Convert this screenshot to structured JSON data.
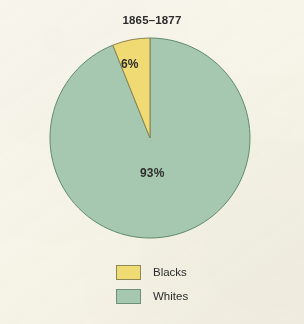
{
  "figure": {
    "width": 304,
    "height": 324,
    "background_color": "#faf8ef"
  },
  "chart_data": {
    "type": "pie",
    "title": "1865–1877",
    "subtitle": "",
    "xlabel": "",
    "ylabel": "",
    "grid": false,
    "legend_position": "bottom",
    "start_angle_deg": 90,
    "direction": "counterclockwise",
    "categories": [
      "Blacks",
      "Whites"
    ],
    "values": [
      6,
      93
    ],
    "value_labels": [
      "6%",
      "93%"
    ],
    "unit": "%",
    "colors": [
      "#f0da73",
      "#a7c8b0"
    ],
    "edge_colors": [
      "#8e8a55",
      "#6e8f79"
    ],
    "slices": [
      {
        "name": "Blacks",
        "value": 6,
        "label": "6%",
        "color": "#f0da73",
        "edge_color": "#8e8a55"
      },
      {
        "name": "Whites",
        "value": 93,
        "label": "93%",
        "color": "#a7c8b0",
        "edge_color": "#6e8f79"
      }
    ],
    "legend": [
      {
        "label": "Blacks",
        "color": "#f0da73"
      },
      {
        "label": "Whites",
        "color": "#a7c8b0"
      }
    ],
    "geometry": {
      "center_x": 150,
      "center_y": 138,
      "radius": 100
    }
  }
}
